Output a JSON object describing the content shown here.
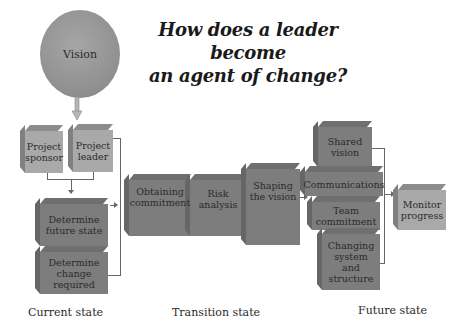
{
  "title": {
    "line1": "How does a leader become",
    "line2": "an agent of change?"
  },
  "vision": {
    "label": "Vision",
    "color": "#9a9a9a"
  },
  "current_state": {
    "label": "Current state",
    "boxes": [
      {
        "id": "project-sponsor",
        "label": "Project sponsor"
      },
      {
        "id": "project-leader",
        "label": "Project leader"
      },
      {
        "id": "determine-future-state",
        "label": "Determine future state"
      },
      {
        "id": "determine-change-required",
        "label": "Determine change required"
      }
    ]
  },
  "transition_state": {
    "label": "Transition state",
    "boxes": [
      {
        "id": "obtaining-commitment",
        "label": "Obtaining commitment"
      },
      {
        "id": "risk-analysis",
        "label": "Risk analysis"
      },
      {
        "id": "shaping-the-vision",
        "label": "Shaping the vision"
      }
    ]
  },
  "future_state": {
    "label": "Future state",
    "boxes": [
      {
        "id": "shared-vision",
        "label": "Shared vision"
      },
      {
        "id": "communications",
        "label": "Communications"
      },
      {
        "id": "team-commitment",
        "label": "Team commitment"
      },
      {
        "id": "changing-system-structure",
        "label": "Changing system and structure"
      },
      {
        "id": "monitor-progress",
        "label": "Monitor progress"
      }
    ]
  },
  "colors": {
    "light_box": "#a9a9a9",
    "dark_box": "#7d7d7d",
    "connector": "#666666"
  }
}
